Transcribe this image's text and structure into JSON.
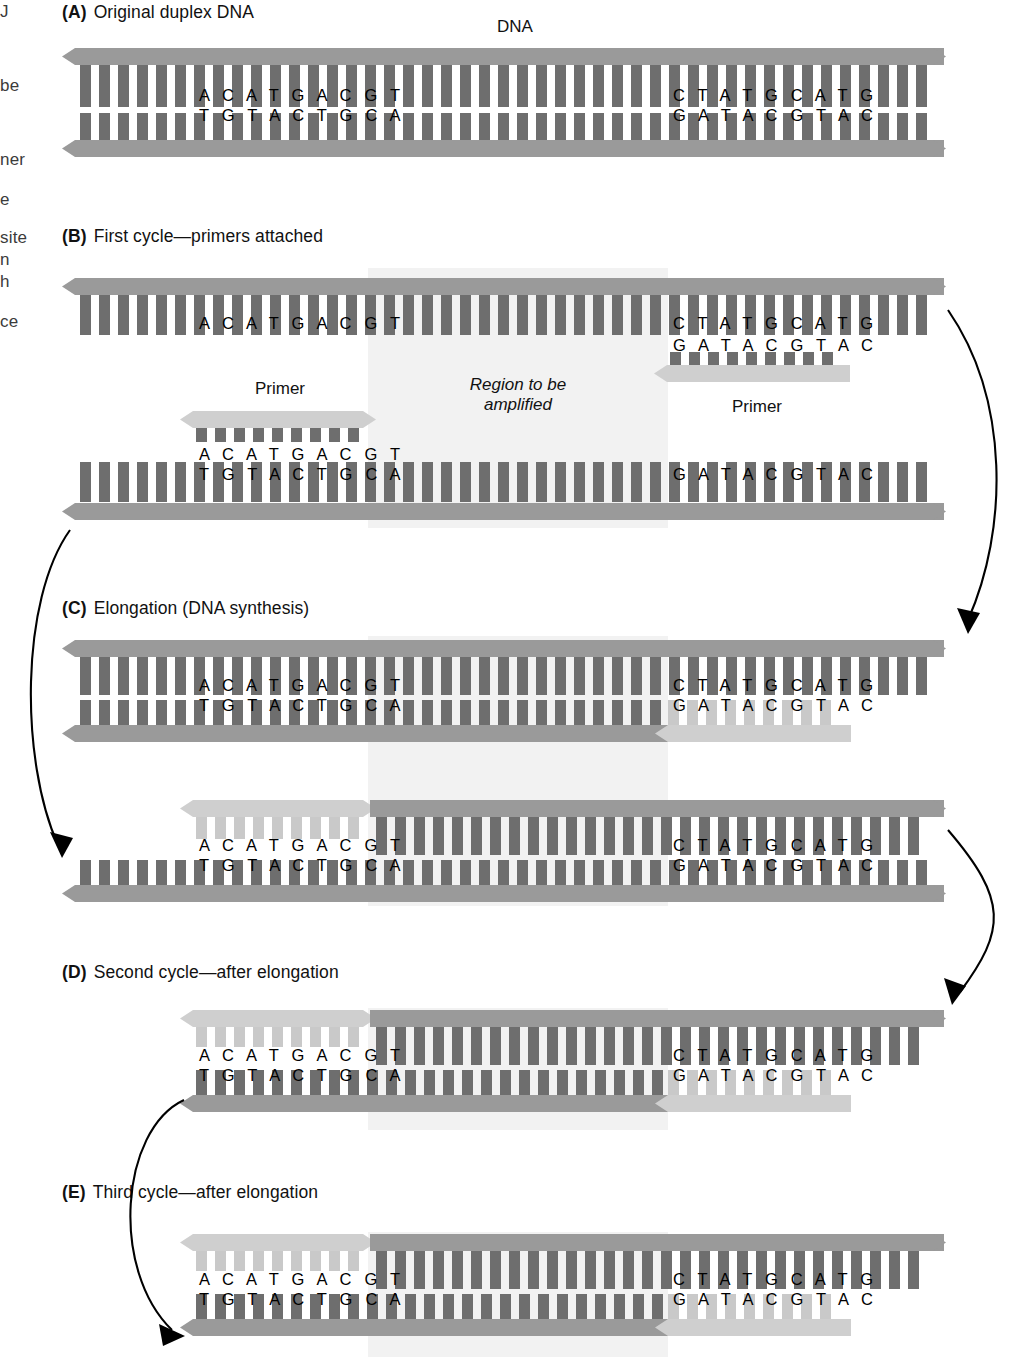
{
  "figure": {
    "title_label": "DNA",
    "margin_fragments": [
      {
        "text": "J",
        "x": 0,
        "y": 2
      },
      {
        "text": "be",
        "x": 0,
        "y": 76
      },
      {
        "text": "ner",
        "x": 0,
        "y": 150
      },
      {
        "text": "e",
        "x": 0,
        "y": 190
      },
      {
        "text": "site",
        "x": 0,
        "y": 228
      },
      {
        "text": "n",
        "x": 0,
        "y": 250
      },
      {
        "text": "h",
        "x": 0,
        "y": 272
      },
      {
        "text": "ce",
        "x": 0,
        "y": 312
      }
    ]
  },
  "panels": [
    {
      "tag": "A",
      "title": "Original duplex DNA",
      "x": 62,
      "y": 2
    },
    {
      "tag": "B",
      "title": "First cycle—primers attached",
      "x": 62,
      "y": 226
    },
    {
      "tag": "C",
      "title": "Elongation (DNA synthesis)",
      "x": 62,
      "y": 598
    },
    {
      "tag": "D",
      "title": "Second cycle—after elongation",
      "x": 62,
      "y": 962
    },
    {
      "tag": "E",
      "title": "Third cycle—after elongation",
      "x": 62,
      "y": 1182
    }
  ],
  "annotations": {
    "primer_left": "Primer",
    "primer_right": "Primer",
    "region_line1": "Region to be",
    "region_line2": "amplified"
  },
  "sequences": {
    "left_top": "A C A T G A C G T",
    "left_bottom": "T G T A C T G C A",
    "right_top": "C T A T G C A T G",
    "right_bottom": "G A T A C G T A C"
  },
  "colors": {
    "backbone_dark": "#9a9a9a",
    "backbone_light": "#cfcfcf",
    "rung_dark": "#6e6e6e",
    "rung_light": "#c9c9c9",
    "amplified_band": "#f2f2f2",
    "text": "#111111",
    "arrow": "#000000"
  }
}
